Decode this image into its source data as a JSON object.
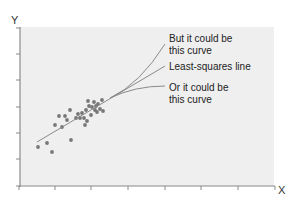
{
  "chart_data": {
    "type": "scatter",
    "title": "",
    "xlabel": "X",
    "ylabel": "Y",
    "grid": false,
    "axis_ticks": {
      "x_tick_count": 8,
      "y_tick_count": 7,
      "tick_labels": false
    },
    "panel_background": "#efefef",
    "point_color": "#777777",
    "line_color": "#888888",
    "points_px": [
      [
        38,
        147
      ],
      [
        47,
        143
      ],
      [
        52,
        152
      ],
      [
        55,
        125
      ],
      [
        59,
        116
      ],
      [
        62,
        127
      ],
      [
        65,
        116
      ],
      [
        67,
        120
      ],
      [
        70,
        110
      ],
      [
        71,
        140
      ],
      [
        76,
        118
      ],
      [
        78,
        114
      ],
      [
        80,
        118
      ],
      [
        82,
        113
      ],
      [
        84,
        118
      ],
      [
        85,
        125
      ],
      [
        86,
        110
      ],
      [
        87,
        121
      ],
      [
        88,
        101
      ],
      [
        89,
        106
      ],
      [
        91,
        115
      ],
      [
        92,
        107
      ],
      [
        94,
        102
      ],
      [
        95,
        110
      ],
      [
        96,
        106
      ],
      [
        97,
        112
      ],
      [
        98,
        104
      ],
      [
        100,
        109
      ],
      [
        102,
        100
      ],
      [
        103,
        111
      ]
    ],
    "series": [
      {
        "name": "Least-squares line",
        "kind": "line",
        "path_px": [
          [
            37,
            142
          ],
          [
            165,
            66
          ]
        ]
      },
      {
        "name": "But it could be this curve",
        "kind": "curve",
        "path_px": [
          [
            110,
            98
          ],
          [
            135,
            82
          ],
          [
            165,
            44
          ]
        ]
      },
      {
        "name": "Or it could be this curve",
        "kind": "curve",
        "path_px": [
          [
            110,
            98
          ],
          [
            135,
            88
          ],
          [
            165,
            86
          ]
        ]
      }
    ],
    "annotations": [
      {
        "text_lines": [
          "But it could be",
          "this curve"
        ],
        "anchor_px": [
          169,
          41
        ]
      },
      {
        "text_lines": [
          "Least-squares line"
        ],
        "anchor_px": [
          169,
          67
        ]
      },
      {
        "text_lines": [
          "Or it could be",
          "this curve"
        ],
        "anchor_px": [
          169,
          91
        ]
      }
    ]
  },
  "labels": {
    "y_axis": "Y",
    "x_axis": "X",
    "upper_curve_line1": "But it could be",
    "upper_curve_line2": "this curve",
    "straight_line": "Least-squares line",
    "lower_curve_line1": "Or it could be",
    "lower_curve_line2": "this curve"
  }
}
